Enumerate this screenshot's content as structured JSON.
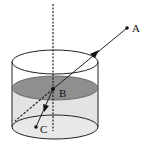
{
  "figure": {
    "type": "refraction-diagram",
    "colors": {
      "stroke": "#222222",
      "water_surface": "#8f8f8f",
      "water_body": "#e3e3e3",
      "bottom_ellipse": "#e6e6e6",
      "background": "#ffffff"
    },
    "points": [
      {
        "id": "A",
        "label": "A",
        "x": 127,
        "y": 28
      },
      {
        "id": "B",
        "label": "B",
        "x": 53,
        "y": 89
      },
      {
        "id": "C",
        "label": "C",
        "x": 36,
        "y": 127
      }
    ],
    "labels": {
      "A": "A",
      "B": "B",
      "C": "C"
    },
    "container": {
      "shape": "cylinder",
      "center_x": 55,
      "rx": 43,
      "ry": 12,
      "top_y": 62,
      "water_y": 88,
      "bottom_y": 127
    },
    "rays": {
      "incident": {
        "from": "A",
        "to": "B",
        "arrow": "toward B"
      },
      "refracted": {
        "from": "B",
        "to": "C",
        "arrow": "toward C"
      },
      "incident_extension": {
        "from": "B",
        "style": "dashed"
      },
      "normal": {
        "x": 53,
        "style": "dashed",
        "orientation": "vertical"
      }
    }
  }
}
